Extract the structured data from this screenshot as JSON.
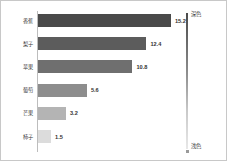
{
  "chart_data": {
    "type": "bar",
    "orientation": "horizontal",
    "title": "",
    "xlabel": "",
    "ylabel": "",
    "grid": false,
    "xlim": [
      0,
      17.5
    ],
    "categories": [
      "香蕉",
      "梨子",
      "苹果",
      "葡萄",
      "芒果",
      "柿子"
    ],
    "values": [
      15.2,
      12.4,
      10.8,
      5.6,
      3.2,
      1.5
    ],
    "value_labels": [
      "15.2",
      "12.4",
      "10.8",
      "5.6",
      "3.2",
      "1.5"
    ],
    "bar_colors": [
      "#4a4a4a",
      "#5c5c5c",
      "#6f6f6f",
      "#8d8d8d",
      "#b4b4b4",
      "#dcdcdc"
    ],
    "legend": {
      "position": "right",
      "type": "gradient-scale",
      "top_label": "深色",
      "bottom_label": "浅色",
      "top_color": "#4a4a4a",
      "bottom_color": "#e8e8e8"
    }
  },
  "colors": {
    "background": "#ffffff",
    "border": "#c8c8c8",
    "axis_line": "#bdbdbd",
    "label_text": "#3a3a3a",
    "value_text": "#333333"
  }
}
